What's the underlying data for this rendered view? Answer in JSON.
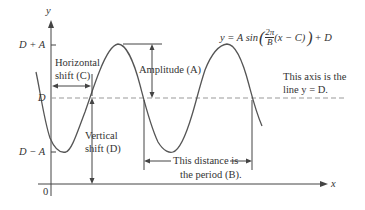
{
  "axes": {
    "x_label": "x",
    "y_label": "y",
    "origin_label": "0"
  },
  "y_ticks": {
    "top": "D + A",
    "middle": "D",
    "bottom": "D − A"
  },
  "equation": "y = A sin((2π/B)(x − C)) + D",
  "equation_parts": {
    "lhs": "y = A sin",
    "num": "2π",
    "den": "B",
    "inner": "(x − C)",
    "rhs": "+ D"
  },
  "annotations": {
    "horizontal_shift": [
      "Horizontal",
      "shift (C)"
    ],
    "amplitude": "Amplitude (A)",
    "vertical_shift": [
      "Vertical",
      "shift (D)"
    ],
    "axis_note": [
      "This axis is the",
      "line y = D."
    ],
    "period": [
      "This distance is",
      "the period (B)."
    ]
  },
  "colors": {
    "curve": "#555555",
    "dashed": "#999999",
    "text": "#333333"
  }
}
